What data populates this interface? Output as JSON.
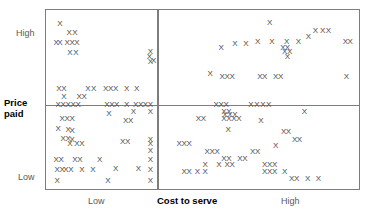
{
  "chart_data": {
    "type": "scatter",
    "title": "",
    "subtitle": "",
    "xlabel": "Cost to serve",
    "ylabel": "Price paid",
    "x_tick_labels": [
      "Low",
      "High"
    ],
    "y_tick_labels": [
      "High",
      "Low"
    ],
    "xlim": [
      0,
      100
    ],
    "ylim": [
      0,
      100
    ],
    "grid": false,
    "legend": "none",
    "marker_symbol": "X",
    "quadrant_divider_x": 35.5,
    "quadrant_divider_y": 47.0,
    "annotations": [],
    "points": [
      {
        "x": 4.4,
        "y": 92.3
      },
      {
        "x": 7.3,
        "y": 87.3
      },
      {
        "x": 9.2,
        "y": 87.3
      },
      {
        "x": 3.2,
        "y": 81.8
      },
      {
        "x": 4.4,
        "y": 81.8
      },
      {
        "x": 6.7,
        "y": 81.8
      },
      {
        "x": 8.3,
        "y": 81.8
      },
      {
        "x": 9.8,
        "y": 81.8
      },
      {
        "x": 7.6,
        "y": 76.2
      },
      {
        "x": 9.5,
        "y": 76.2
      },
      {
        "x": 33.3,
        "y": 76.8
      },
      {
        "x": 33.3,
        "y": 70.7
      },
      {
        "x": 4.1,
        "y": 55.8
      },
      {
        "x": 5.7,
        "y": 55.8
      },
      {
        "x": 13.3,
        "y": 55.8
      },
      {
        "x": 15.2,
        "y": 55.8
      },
      {
        "x": 19.0,
        "y": 55.8
      },
      {
        "x": 20.6,
        "y": 55.8
      },
      {
        "x": 22.2,
        "y": 55.8
      },
      {
        "x": 25.7,
        "y": 55.8
      },
      {
        "x": 28.9,
        "y": 55.8
      },
      {
        "x": 33.0,
        "y": 74.0
      },
      {
        "x": 34.3,
        "y": 71.3
      },
      {
        "x": 5.7,
        "y": 51.4
      },
      {
        "x": 10.5,
        "y": 51.4
      },
      {
        "x": 12.1,
        "y": 51.4
      },
      {
        "x": 3.8,
        "y": 47.0
      },
      {
        "x": 5.4,
        "y": 47.0
      },
      {
        "x": 7.0,
        "y": 47.0
      },
      {
        "x": 8.6,
        "y": 47.0
      },
      {
        "x": 10.2,
        "y": 47.0
      },
      {
        "x": 19.4,
        "y": 47.0
      },
      {
        "x": 21.0,
        "y": 47.0
      },
      {
        "x": 22.5,
        "y": 47.0
      },
      {
        "x": 25.7,
        "y": 47.0
      },
      {
        "x": 28.6,
        "y": 47.0
      },
      {
        "x": 30.2,
        "y": 47.0
      },
      {
        "x": 31.7,
        "y": 47.0
      },
      {
        "x": 33.3,
        "y": 47.0
      },
      {
        "x": 20.0,
        "y": 42.0
      },
      {
        "x": 27.9,
        "y": 43.1
      },
      {
        "x": 33.3,
        "y": 43.1
      },
      {
        "x": 5.1,
        "y": 39.2
      },
      {
        "x": 6.7,
        "y": 39.2
      },
      {
        "x": 8.3,
        "y": 39.2
      },
      {
        "x": 25.4,
        "y": 38.1
      },
      {
        "x": 27.0,
        "y": 38.1
      },
      {
        "x": 3.8,
        "y": 33.7
      },
      {
        "x": 7.0,
        "y": 33.1
      },
      {
        "x": 8.3,
        "y": 32.6
      },
      {
        "x": 5.4,
        "y": 28.2
      },
      {
        "x": 7.0,
        "y": 28.2
      },
      {
        "x": 8.3,
        "y": 27.6
      },
      {
        "x": 7.6,
        "y": 25.4
      },
      {
        "x": 9.8,
        "y": 25.4
      },
      {
        "x": 11.4,
        "y": 25.4
      },
      {
        "x": 24.4,
        "y": 26.5
      },
      {
        "x": 26.0,
        "y": 26.5
      },
      {
        "x": 33.3,
        "y": 27.1
      },
      {
        "x": 33.3,
        "y": 25.4
      },
      {
        "x": 33.3,
        "y": 21.0
      },
      {
        "x": 3.2,
        "y": 16.0
      },
      {
        "x": 4.8,
        "y": 16.0
      },
      {
        "x": 9.2,
        "y": 16.0
      },
      {
        "x": 10.8,
        "y": 16.0
      },
      {
        "x": 17.1,
        "y": 16.0
      },
      {
        "x": 33.3,
        "y": 16.0
      },
      {
        "x": 3.5,
        "y": 10.5
      },
      {
        "x": 5.1,
        "y": 10.5
      },
      {
        "x": 6.3,
        "y": 10.5
      },
      {
        "x": 7.9,
        "y": 10.5
      },
      {
        "x": 11.4,
        "y": 10.5
      },
      {
        "x": 14.9,
        "y": 10.5
      },
      {
        "x": 22.2,
        "y": 11.0
      },
      {
        "x": 29.5,
        "y": 11.0
      },
      {
        "x": 33.3,
        "y": 10.5
      },
      {
        "x": 3.5,
        "y": 4.4
      },
      {
        "x": 19.7,
        "y": 4.4
      },
      {
        "x": 33.3,
        "y": 4.4
      },
      {
        "x": 71.4,
        "y": 92.8
      },
      {
        "x": 86.0,
        "y": 88.4
      },
      {
        "x": 88.3,
        "y": 88.4
      },
      {
        "x": 90.2,
        "y": 88.4
      },
      {
        "x": 83.8,
        "y": 85.1
      },
      {
        "x": 67.6,
        "y": 82.3
      },
      {
        "x": 72.1,
        "y": 82.3
      },
      {
        "x": 76.8,
        "y": 82.3
      },
      {
        "x": 80.6,
        "y": 82.3
      },
      {
        "x": 95.6,
        "y": 82.3
      },
      {
        "x": 97.1,
        "y": 82.3
      },
      {
        "x": 55.9,
        "y": 79.0
      },
      {
        "x": 60.3,
        "y": 81.2
      },
      {
        "x": 63.8,
        "y": 81.2
      },
      {
        "x": 75.6,
        "y": 78.5
      },
      {
        "x": 77.1,
        "y": 78.5
      },
      {
        "x": 76.2,
        "y": 76.8
      },
      {
        "x": 77.8,
        "y": 76.8
      },
      {
        "x": 77.1,
        "y": 74.0
      },
      {
        "x": 52.4,
        "y": 64.1
      },
      {
        "x": 56.2,
        "y": 62.4
      },
      {
        "x": 57.8,
        "y": 62.4
      },
      {
        "x": 59.4,
        "y": 62.4
      },
      {
        "x": 68.3,
        "y": 62.4
      },
      {
        "x": 69.8,
        "y": 62.4
      },
      {
        "x": 73.3,
        "y": 62.4
      },
      {
        "x": 74.9,
        "y": 62.4
      },
      {
        "x": 95.9,
        "y": 62.4
      },
      {
        "x": 54.3,
        "y": 47.0
      },
      {
        "x": 55.9,
        "y": 47.0
      },
      {
        "x": 57.5,
        "y": 47.0
      },
      {
        "x": 65.4,
        "y": 47.0
      },
      {
        "x": 67.3,
        "y": 47.0
      },
      {
        "x": 69.2,
        "y": 47.0
      },
      {
        "x": 71.1,
        "y": 47.0
      },
      {
        "x": 56.8,
        "y": 43.1
      },
      {
        "x": 58.4,
        "y": 43.1
      },
      {
        "x": 57.1,
        "y": 41.4
      },
      {
        "x": 58.7,
        "y": 41.4
      },
      {
        "x": 60.3,
        "y": 41.4
      },
      {
        "x": 82.5,
        "y": 43.1
      },
      {
        "x": 48.6,
        "y": 39.2
      },
      {
        "x": 50.2,
        "y": 39.2
      },
      {
        "x": 56.8,
        "y": 39.2
      },
      {
        "x": 58.4,
        "y": 39.2
      },
      {
        "x": 60.0,
        "y": 39.2
      },
      {
        "x": 61.6,
        "y": 39.2
      },
      {
        "x": 68.6,
        "y": 38.1
      },
      {
        "x": 58.1,
        "y": 33.1
      },
      {
        "x": 75.9,
        "y": 32.0
      },
      {
        "x": 77.4,
        "y": 32.0
      },
      {
        "x": 79.4,
        "y": 27.6
      },
      {
        "x": 80.9,
        "y": 27.6
      },
      {
        "x": 42.5,
        "y": 25.4
      },
      {
        "x": 44.1,
        "y": 25.4
      },
      {
        "x": 45.7,
        "y": 25.4
      },
      {
        "x": 73.3,
        "y": 24.3
      },
      {
        "x": 51.4,
        "y": 20.4
      },
      {
        "x": 53.0,
        "y": 20.4
      },
      {
        "x": 54.6,
        "y": 20.4
      },
      {
        "x": 66.0,
        "y": 20.4
      },
      {
        "x": 67.6,
        "y": 20.4
      },
      {
        "x": 56.8,
        "y": 16.6
      },
      {
        "x": 58.4,
        "y": 16.6
      },
      {
        "x": 61.9,
        "y": 16.6
      },
      {
        "x": 63.5,
        "y": 16.6
      },
      {
        "x": 50.8,
        "y": 13.3
      },
      {
        "x": 55.2,
        "y": 13.3
      },
      {
        "x": 57.8,
        "y": 13.3
      },
      {
        "x": 59.4,
        "y": 13.3
      },
      {
        "x": 69.8,
        "y": 13.3
      },
      {
        "x": 71.4,
        "y": 13.3
      },
      {
        "x": 73.0,
        "y": 13.3
      },
      {
        "x": 44.1,
        "y": 9.4
      },
      {
        "x": 45.7,
        "y": 9.4
      },
      {
        "x": 48.3,
        "y": 9.4
      },
      {
        "x": 50.8,
        "y": 9.4
      },
      {
        "x": 69.8,
        "y": 9.4
      },
      {
        "x": 71.4,
        "y": 9.4
      },
      {
        "x": 73.0,
        "y": 9.4
      },
      {
        "x": 76.2,
        "y": 9.4
      },
      {
        "x": 78.4,
        "y": 5.5
      },
      {
        "x": 80.0,
        "y": 5.5
      },
      {
        "x": 83.5,
        "y": 5.5
      },
      {
        "x": 87.0,
        "y": 5.5
      }
    ]
  },
  "labels": {
    "y_high": "High",
    "y_low": "Low",
    "x_low": "Low",
    "x_high": "High",
    "x_title": "Cost to serve",
    "y_title_line1": "Price",
    "y_title_line2": "paid"
  },
  "colors": {
    "frame": "#7d7d7d",
    "marker": "#4a4a4a",
    "axis_label": "#5a5a5a",
    "axis_title": "#000000",
    "background": "#ffffff"
  }
}
